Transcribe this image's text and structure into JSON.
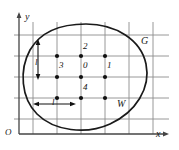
{
  "figure": {
    "axes": {
      "y_label": "y",
      "x_label": "x",
      "origin_label": "O"
    },
    "region_label": "G",
    "window_label": "W",
    "spacing_label_vertical": "l",
    "spacing_label_horizontal": "l",
    "lattice_points": [
      {
        "id": "p0",
        "label": "0",
        "cx": 86,
        "cy": 66
      },
      {
        "id": "p1",
        "label": "1",
        "cx": 110,
        "cy": 66
      },
      {
        "id": "p2",
        "label": "2",
        "cx": 86,
        "cy": 48
      },
      {
        "id": "p3",
        "label": "3",
        "cx": 62,
        "cy": 66
      },
      {
        "id": "p4",
        "label": "4",
        "cx": 86,
        "cy": 88
      },
      {
        "id": "pA",
        "label": "",
        "cx": 62,
        "cy": 48
      },
      {
        "id": "pB",
        "label": "",
        "cx": 110,
        "cy": 48
      },
      {
        "id": "pC",
        "label": "",
        "cx": 62,
        "cy": 88
      },
      {
        "id": "pD",
        "label": "",
        "cx": 110,
        "cy": 88
      }
    ],
    "colors": {
      "grid": "#8c8c8c",
      "axis": "#444444",
      "curve": "#1a1a1a",
      "point": "#111111",
      "text": "#1a1a1a"
    }
  }
}
